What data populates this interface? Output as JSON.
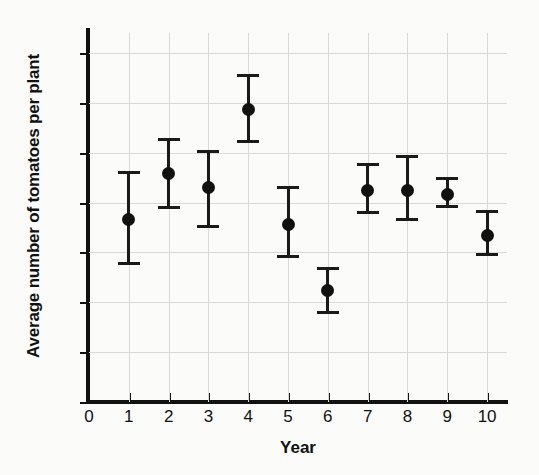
{
  "chart_data": {
    "type": "scatter",
    "title": "",
    "xlabel": "Year",
    "ylabel": "Average number of tomatoes per plant",
    "xlim": [
      0,
      10.5
    ],
    "ylim": [
      0,
      74
    ],
    "grid": true,
    "legend": "none",
    "x_tick_labels": [
      "0",
      "1",
      "2",
      "3",
      "4",
      "5",
      "6",
      "7",
      "8",
      "9",
      "10"
    ],
    "y_tick_labels": [
      "0",
      "10",
      "20",
      "30",
      "40",
      "50",
      "60",
      "70"
    ],
    "x_ticks": [
      0,
      1,
      2,
      3,
      4,
      5,
      6,
      7,
      8,
      9,
      10
    ],
    "y_ticks": [
      0,
      10,
      20,
      30,
      40,
      50,
      60,
      70
    ],
    "marker": "filled-circle",
    "error_bars": "vertical-with-caps",
    "x": [
      1,
      2,
      3,
      4,
      5,
      6,
      7,
      8,
      9,
      10
    ],
    "values": [
      36.6,
      45.8,
      43.0,
      58.7,
      35.6,
      22.3,
      42.4,
      42.4,
      41.6,
      33.3
    ],
    "err_low": [
      27.5,
      38.8,
      34.8,
      51.9,
      28.8,
      17.6,
      37.7,
      36.3,
      38.9,
      29.2
    ],
    "err_high": [
      46.3,
      52.9,
      50.5,
      65.8,
      43.3,
      27.0,
      47.9,
      49.6,
      45.2,
      38.5
    ],
    "points": [
      {
        "year": 1,
        "mean": 36.6,
        "low": 27.5,
        "high": 46.3
      },
      {
        "year": 2,
        "mean": 45.8,
        "low": 38.8,
        "high": 52.9
      },
      {
        "year": 3,
        "mean": 43.0,
        "low": 34.8,
        "high": 50.5
      },
      {
        "year": 4,
        "mean": 58.7,
        "low": 51.9,
        "high": 65.8
      },
      {
        "year": 5,
        "mean": 35.6,
        "low": 28.8,
        "high": 43.3
      },
      {
        "year": 6,
        "mean": 22.3,
        "low": 17.6,
        "high": 27.0
      },
      {
        "year": 7,
        "mean": 42.4,
        "low": 37.7,
        "high": 47.9
      },
      {
        "year": 8,
        "mean": 42.4,
        "low": 36.3,
        "high": 49.6
      },
      {
        "year": 9,
        "mean": 41.6,
        "low": 38.9,
        "high": 45.2
      },
      {
        "year": 10,
        "mean": 33.3,
        "low": 29.2,
        "high": 38.5
      }
    ],
    "colors": {
      "marker": "#111111",
      "errorbar": "#1a1a1a",
      "grid": "#d9d9d9",
      "axis": "#111111",
      "background": "#fbfbfa"
    }
  }
}
